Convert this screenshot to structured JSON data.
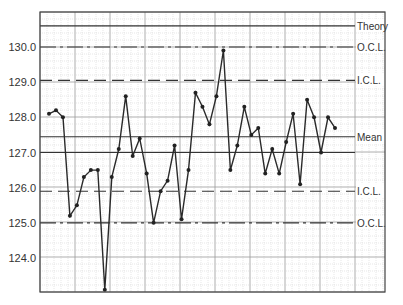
{
  "chart_data": {
    "type": "line",
    "title": "",
    "xlabel": "",
    "ylabel": "",
    "ylim": [
      123.0,
      130.9
    ],
    "yticks": [
      124.0,
      125.0,
      126.0,
      127.0,
      128.0,
      129.0,
      130.0
    ],
    "ytick_labels": [
      "124.0",
      "125.0",
      "126.0",
      "127.0",
      "128.0",
      "129.0",
      "130.0"
    ],
    "grid": true,
    "series": [
      {
        "name": "Measurements",
        "values": [
          128.1,
          128.2,
          128.0,
          125.2,
          125.5,
          126.3,
          126.5,
          126.5,
          123.1,
          126.3,
          127.1,
          128.6,
          126.9,
          127.4,
          126.4,
          125.0,
          125.9,
          126.2,
          127.2,
          125.1,
          126.5,
          128.7,
          128.3,
          127.8,
          128.6,
          129.9,
          126.5,
          127.2,
          128.3,
          127.5,
          127.7,
          126.4,
          127.1,
          126.4,
          127.3,
          128.1,
          126.1,
          128.5,
          128.0,
          127.0,
          128.0,
          127.7
        ]
      }
    ],
    "reference_lines": [
      {
        "name": "Theory",
        "value": 130.6,
        "style": "solid"
      },
      {
        "name": "O.C.L.",
        "value": 130.0,
        "style": "dashdot"
      },
      {
        "name": "I.C.L.",
        "value": 129.05,
        "style": "dashed"
      },
      {
        "name": "Mean",
        "value": 127.45,
        "style": "solid"
      },
      {
        "name": "I.C.L.",
        "value": 125.9,
        "style": "dashed"
      },
      {
        "name": "O.C.L.",
        "value": 125.0,
        "style": "dashdot"
      }
    ],
    "extra_lines": [
      {
        "value": 127.0,
        "style": "solid"
      }
    ]
  },
  "labels": {
    "theory": "Theory",
    "ocl_upper": "O.C.L.",
    "icl_upper": "I.C.L.",
    "mean": "Mean",
    "icl_lower": "I.C.L.",
    "ocl_lower": "O.C.L."
  }
}
